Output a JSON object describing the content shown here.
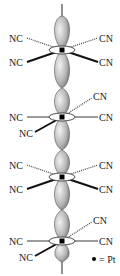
{
  "diagram": {
    "ligand_label_left": "NC",
    "ligand_label_right": "CN",
    "legend": {
      "symbol": "●",
      "text": "= Pt"
    },
    "units": [
      {
        "y": 50,
        "top_left": "NC",
        "top_right": "CN",
        "bottom_left": "NC",
        "bottom_right": "CN",
        "orientation": "eclipsed-A"
      },
      {
        "y": 117,
        "top_right": "CN",
        "left": "NC",
        "right": "CN",
        "bottom_left": "NC",
        "orientation": "staggered-B"
      },
      {
        "y": 177,
        "top_left": "NC",
        "top_right": "CN",
        "bottom_left": "NC",
        "bottom_right": "CN",
        "orientation": "eclipsed-A"
      },
      {
        "y": 241,
        "top_right": "CN",
        "left": "NC",
        "right": "CN",
        "bottom_left": "NC",
        "orientation": "staggered-B"
      }
    ],
    "colors": {
      "orbital_fill_light": "#e6e6e6",
      "orbital_fill_dark": "#8a8a8a",
      "line": "#222222",
      "pt": "#000000"
    }
  }
}
